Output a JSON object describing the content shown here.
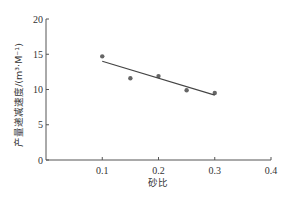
{
  "chart_data": {
    "type": "scatter",
    "title": "",
    "xlabel": "砂比",
    "ylabel": "产量递减速度/(m³·M⁻¹)",
    "xlim": [
      0,
      0.4
    ],
    "ylim": [
      0,
      20
    ],
    "x_ticks": [
      "0.1",
      "0.2",
      "0.3",
      "0.4"
    ],
    "y_ticks": [
      "0",
      "5",
      "10",
      "15",
      "20"
    ],
    "grid": false,
    "legend": null,
    "series": [
      {
        "name": "实测数据",
        "type": "scatter",
        "x": [
          0.1,
          0.15,
          0.2,
          0.25,
          0.3
        ],
        "y": [
          14.7,
          11.6,
          11.9,
          9.9,
          9.5
        ]
      },
      {
        "name": "拟合线",
        "type": "line",
        "x": [
          0.1,
          0.3
        ],
        "y": [
          14.0,
          9.2
        ]
      }
    ]
  }
}
